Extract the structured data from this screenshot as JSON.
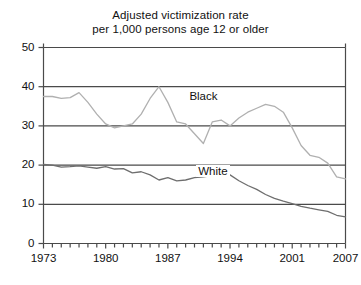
{
  "chart_data": {
    "type": "line",
    "title": "Adjusted victimization rate per 1,000 persons age 12 or older",
    "title_lines": [
      "Adjusted victimization rate",
      "per 1,000 persons age 12 or older"
    ],
    "xlabel": "",
    "ylabel": "",
    "xlim": [
      1973,
      2007
    ],
    "ylim": [
      0,
      50
    ],
    "yticks": [
      0,
      10,
      20,
      30,
      40,
      50
    ],
    "ytick_labels": [
      "0",
      "10",
      "20",
      "30",
      "40",
      "50"
    ],
    "xticks": [
      1973,
      1980,
      1987,
      1994,
      2001,
      2007
    ],
    "xtick_labels": [
      "1973",
      "1980",
      "1987",
      "1994",
      "2001",
      "2007"
    ],
    "minor_xticks_every": 1,
    "grid": "horizontal",
    "gridlines_at": [
      10,
      20,
      30,
      40
    ],
    "legend": "inline-labels",
    "x": [
      1973,
      1974,
      1975,
      1976,
      1977,
      1978,
      1979,
      1980,
      1981,
      1982,
      1983,
      1984,
      1985,
      1986,
      1987,
      1988,
      1989,
      1990,
      1991,
      1992,
      1993,
      1994,
      1995,
      1996,
      1997,
      1998,
      1999,
      2000,
      2001,
      2002,
      2003,
      2004,
      2005,
      2006,
      2007
    ],
    "series": [
      {
        "name": "Black",
        "color": "#b0b0b0",
        "label_x": 1991,
        "label_y": 37,
        "values": [
          37.5,
          37.5,
          37.0,
          37.2,
          38.5,
          36.0,
          33.0,
          30.5,
          29.5,
          30.0,
          30.5,
          33.0,
          37.0,
          40.0,
          36.0,
          31.0,
          30.5,
          28.0,
          25.5,
          31.0,
          31.5,
          30.0,
          32.0,
          33.5,
          34.5,
          35.5,
          35.0,
          33.5,
          29.5,
          25.0,
          22.5,
          22.0,
          20.5,
          17.0,
          16.5
        ],
        "values_note": "light gray line, higher series"
      },
      {
        "name": "White",
        "color": "#6e6e6e",
        "label_x": 1992,
        "label_y": 18,
        "values": [
          20.2,
          20.0,
          19.5,
          19.6,
          19.8,
          19.5,
          19.2,
          19.6,
          19.0,
          19.1,
          18.0,
          18.3,
          17.5,
          16.2,
          16.8,
          16.0,
          16.2,
          16.8,
          17.0,
          17.3,
          17.8,
          17.5,
          16.0,
          14.8,
          13.8,
          12.5,
          11.5,
          10.8,
          10.2,
          9.5,
          9.0,
          8.6,
          8.2,
          7.2,
          6.8
        ],
        "values_note": "dark gray line, lower series"
      }
    ]
  },
  "axes": {
    "frame_color": "#4a4a4a",
    "grid_color": "#4a4a4a"
  }
}
